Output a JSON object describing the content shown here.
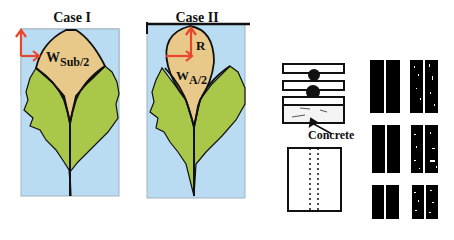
{
  "panels": {
    "case1": {
      "title": "Case I",
      "width_label_main": "W",
      "width_label_sub": "Sub/2"
    },
    "case2": {
      "title": "Case II",
      "radius_label": "R",
      "width_label_main": "W",
      "width_label_sub": "A/2"
    }
  },
  "schematic": {
    "concrete_label": "Concrete"
  },
  "colors": {
    "sky": "#b9dcf2",
    "leaf": "#a9c84a",
    "tip": "#e8c98a",
    "arrow": "#e8452c",
    "outline": "#111111"
  }
}
